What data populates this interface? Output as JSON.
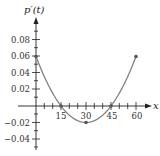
{
  "chart_data": {
    "type": "line",
    "title": "",
    "xlabel": "x",
    "ylabel": "p'(t)",
    "x_ticks": [
      15,
      30,
      45,
      60
    ],
    "x_tick_labels": [
      "15",
      "30",
      "45",
      "60"
    ],
    "y_ticks": [
      -0.04,
      -0.02,
      0.02,
      0.04,
      0.06,
      0.08
    ],
    "y_tick_labels": [
      "−0.04",
      "−0.02",
      "0.02",
      "0.04",
      "0.06",
      "0.08"
    ],
    "xlim": [
      0,
      66
    ],
    "ylim": [
      -0.045,
      0.09
    ],
    "grid": false,
    "legend": null,
    "series": [
      {
        "name": "p'(t)",
        "x": [
          0,
          5,
          10,
          15,
          20,
          25,
          30,
          35,
          40,
          45,
          50,
          55,
          60
        ],
        "values": [
          0.06,
          0.0356,
          0.0156,
          0.0,
          -0.0111,
          -0.0178,
          -0.02,
          -0.0178,
          -0.0111,
          0.0,
          0.0156,
          0.0356,
          0.06
        ],
        "color": "#777777"
      }
    ],
    "marked_points": [
      {
        "x": 0,
        "y": 0.06
      },
      {
        "x": 15,
        "y": 0
      },
      {
        "x": 30,
        "y": -0.02
      },
      {
        "x": 45,
        "y": 0
      },
      {
        "x": 60,
        "y": 0.06
      }
    ]
  },
  "labels": {
    "y_axis_title": "p′(t)",
    "x_axis_title": "x",
    "x15": "15",
    "x30": "30",
    "x45": "45",
    "x60": "60",
    "y008": "0.08",
    "y006": "0.06",
    "y004": "0.04",
    "y002": "0.02",
    "yn002": "−0.02",
    "yn004": "−0.04"
  }
}
